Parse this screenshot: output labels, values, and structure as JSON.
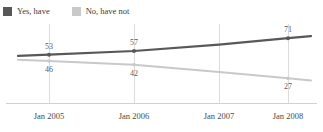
{
  "legend": {
    "items": [
      {
        "label": "Yes, have",
        "color": "#585858",
        "icon": "legend-swatch-icon"
      },
      {
        "label": "No, have not",
        "color": "#c9c9c9",
        "icon": "legend-swatch-icon"
      }
    ]
  },
  "axis": {
    "x_ticks": [
      "Jan 2005",
      "Jan 2006",
      "Jan 2007",
      "Jan 2008"
    ]
  },
  "labels": {
    "yes_start": "53",
    "yes_second": "57",
    "yes_end": "71",
    "no_start": "46",
    "no_second": "42",
    "no_end": "27"
  },
  "chart_data": {
    "type": "line",
    "title": "",
    "subtitle": "",
    "xlabel": "",
    "ylabel": "",
    "categories": [
      "Jan 2005",
      "Jan 2006",
      "Jan 2007",
      "Jan 2008"
    ],
    "series": [
      {
        "name": "Yes, have",
        "color": "#585858",
        "values": [
          53,
          57,
          64,
          71
        ],
        "point_labels": [
          "53",
          "57",
          "",
          "71"
        ],
        "label_position": "above"
      },
      {
        "name": "No, have not",
        "color": "#c9c9c9",
        "values": [
          46,
          42,
          34,
          27
        ],
        "point_labels": [
          "46",
          "42",
          "",
          "27"
        ],
        "label_position": "below"
      }
    ],
    "ylim": [
      0,
      80
    ],
    "grid": "vertical-only",
    "legend_position": "top-left",
    "baseline_axis": true
  }
}
